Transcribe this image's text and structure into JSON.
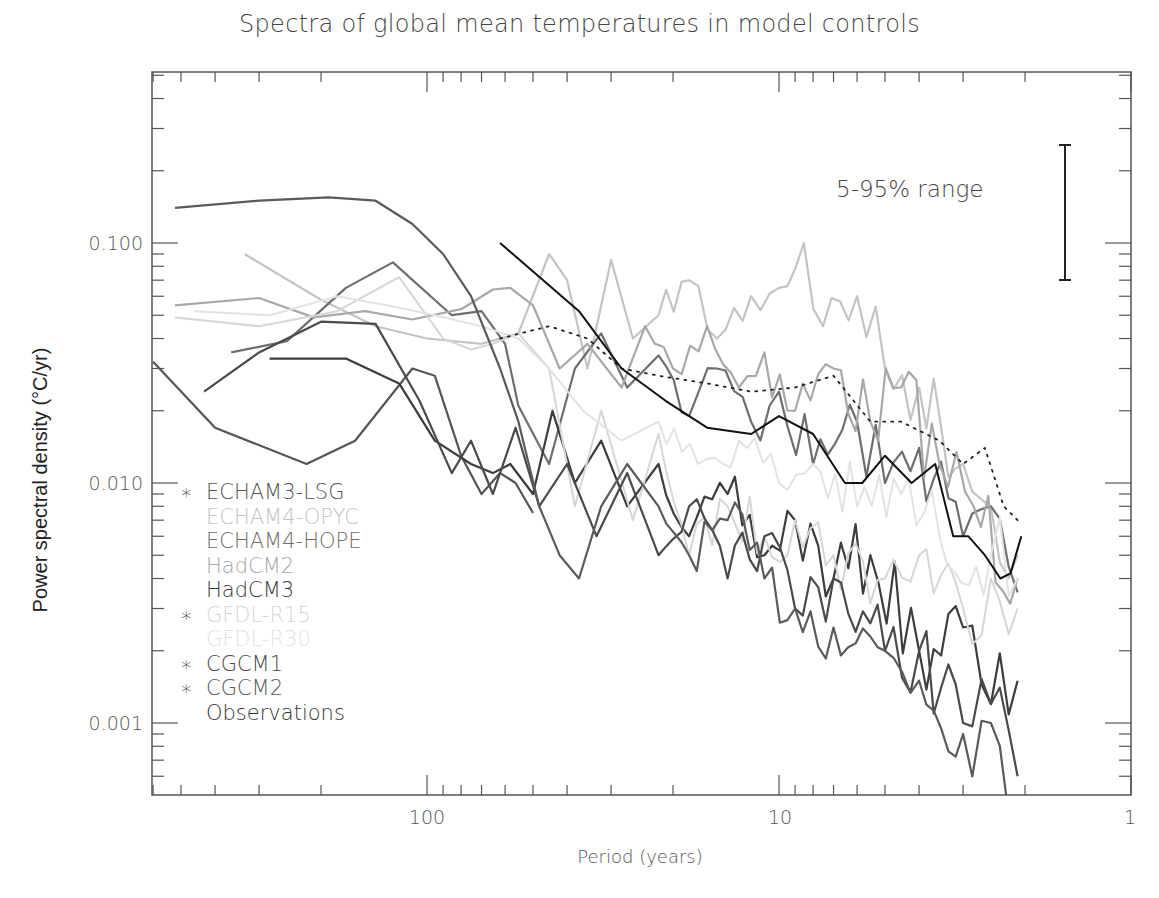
{
  "chart_data": {
    "type": "line",
    "title": "Spectra of global mean temperatures in model controls",
    "xlabel": "Period (years)",
    "ylabel": "Power spectral density (°C/yr)",
    "x_scale": "log",
    "y_scale": "log",
    "x_reversed": true,
    "xlim": [
      600,
      1
    ],
    "ylim": [
      0.0005,
      0.5
    ],
    "x_ticks": [
      {
        "value": 100,
        "label": "100"
      },
      {
        "value": 10,
        "label": "10"
      },
      {
        "value": 1,
        "label": "1"
      }
    ],
    "y_ticks": [
      {
        "value": 0.1,
        "label": "0.100"
      },
      {
        "value": 0.01,
        "label": "0.010"
      },
      {
        "value": 0.001,
        "label": "0.001"
      }
    ],
    "annotation": {
      "label": "5-95% range",
      "x_period": 1.6,
      "y_low": 0.07,
      "y_high": 0.25
    },
    "legend_position": "lower-left inside",
    "series": [
      {
        "name": "ECHAM3-LSG",
        "marker": "*",
        "color": "#555555",
        "width": 2.2,
        "points": [
          [
            600,
            0.032
          ],
          [
            400,
            0.017
          ],
          [
            220,
            0.012
          ],
          [
            160,
            0.015
          ],
          [
            110,
            0.03
          ],
          [
            95,
            0.028
          ],
          [
            80,
            0.013
          ],
          [
            70,
            0.009
          ],
          [
            62,
            0.011
          ],
          [
            56,
            0.01
          ],
          [
            50,
            0.0075
          ]
        ]
      },
      {
        "name": "ECHAM4-OPYC",
        "marker": "",
        "color": "#c4c4c4",
        "width": 2.2,
        "points": [
          [
            330,
            0.09
          ],
          [
            200,
            0.058
          ],
          [
            140,
            0.045
          ],
          [
            100,
            0.04
          ],
          [
            70,
            0.038
          ],
          [
            55,
            0.042
          ],
          [
            45,
            0.09
          ],
          [
            40,
            0.07
          ],
          [
            35,
            0.03
          ],
          [
            30,
            0.085
          ],
          [
            26,
            0.04
          ],
          [
            22,
            0.05
          ],
          [
            18,
            0.07
          ],
          [
            15,
            0.04
          ],
          [
            12,
            0.06
          ],
          [
            10,
            0.065
          ],
          [
            8.5,
            0.1
          ],
          [
            7.5,
            0.045
          ],
          [
            6,
            0.06
          ],
          [
            5,
            0.03
          ],
          [
            4,
            0.025
          ],
          [
            3,
            0.012
          ],
          [
            2.5,
            0.008
          ],
          [
            2.1,
            0.005
          ]
        ]
      },
      {
        "name": "ECHAM4-HOPE",
        "marker": "",
        "color": "#6e6e6e",
        "width": 2.2,
        "points": [
          [
            360,
            0.035
          ],
          [
            250,
            0.039
          ],
          [
            170,
            0.065
          ],
          [
            125,
            0.083
          ],
          [
            85,
            0.05
          ],
          [
            70,
            0.052
          ],
          [
            60,
            0.038
          ],
          [
            55,
            0.021
          ],
          [
            45,
            0.012
          ],
          [
            38,
            0.03
          ],
          [
            32,
            0.042
          ],
          [
            27,
            0.025
          ],
          [
            22,
            0.034
          ],
          [
            18,
            0.019
          ],
          [
            15,
            0.03
          ],
          [
            12,
            0.018
          ],
          [
            10,
            0.024
          ],
          [
            8,
            0.012
          ],
          [
            6,
            0.018
          ],
          [
            5,
            0.01
          ],
          [
            4,
            0.014
          ],
          [
            3,
            0.006
          ],
          [
            2.5,
            0.008
          ],
          [
            2.1,
            0.0035
          ]
        ]
      },
      {
        "name": "HadCM2",
        "marker": "",
        "color": "#a8a8a8",
        "width": 2.2,
        "points": [
          [
            520,
            0.055
          ],
          [
            300,
            0.059
          ],
          [
            210,
            0.049
          ],
          [
            150,
            0.052
          ],
          [
            110,
            0.048
          ],
          [
            80,
            0.053
          ],
          [
            65,
            0.064
          ],
          [
            58,
            0.065
          ],
          [
            50,
            0.055
          ],
          [
            42,
            0.03
          ],
          [
            35,
            0.038
          ],
          [
            28,
            0.025
          ],
          [
            24,
            0.045
          ],
          [
            20,
            0.03
          ],
          [
            16,
            0.045
          ],
          [
            13,
            0.025
          ],
          [
            11,
            0.035
          ],
          [
            9,
            0.02
          ],
          [
            7,
            0.03
          ],
          [
            5.5,
            0.018
          ],
          [
            4.5,
            0.025
          ],
          [
            3.5,
            0.012
          ],
          [
            2.8,
            0.008
          ],
          [
            2.1,
            0.004
          ]
        ]
      },
      {
        "name": "HadCM3",
        "marker": "",
        "color": "#3c3c3c",
        "width": 2.2,
        "points": [
          [
            280,
            0.033
          ],
          [
            170,
            0.033
          ],
          [
            120,
            0.026
          ],
          [
            95,
            0.015
          ],
          [
            75,
            0.012
          ],
          [
            65,
            0.011
          ],
          [
            58,
            0.012
          ],
          [
            50,
            0.009
          ],
          [
            44,
            0.02
          ],
          [
            38,
            0.01
          ],
          [
            32,
            0.015
          ],
          [
            27,
            0.008
          ],
          [
            22,
            0.012
          ],
          [
            18,
            0.006
          ],
          [
            14,
            0.009
          ],
          [
            11,
            0.005
          ],
          [
            9,
            0.007
          ],
          [
            7,
            0.004
          ],
          [
            5.5,
            0.005
          ],
          [
            4,
            0.002
          ],
          [
            3,
            0.0025
          ],
          [
            2.5,
            0.0012
          ],
          [
            2.1,
            0.0015
          ]
        ]
      },
      {
        "name": "GFDL-R15",
        "marker": "*",
        "color": "#d6d6d6",
        "width": 2.0,
        "points": [
          [
            520,
            0.049
          ],
          [
            300,
            0.045
          ],
          [
            180,
            0.052
          ],
          [
            120,
            0.072
          ],
          [
            90,
            0.04
          ],
          [
            75,
            0.036
          ],
          [
            65,
            0.038
          ],
          [
            55,
            0.042
          ],
          [
            45,
            0.03
          ],
          [
            38,
            0.008
          ],
          [
            32,
            0.02
          ],
          [
            26,
            0.007
          ],
          [
            22,
            0.016
          ],
          [
            18,
            0.005
          ],
          [
            14,
            0.008
          ],
          [
            11,
            0.006
          ],
          [
            9,
            0.007
          ],
          [
            7,
            0.005
          ],
          [
            5,
            0.004
          ],
          [
            4,
            0.005
          ],
          [
            3,
            0.003
          ],
          [
            2.5,
            0.004
          ],
          [
            2.1,
            0.003
          ]
        ]
      },
      {
        "name": "GFDL-R30",
        "marker": "",
        "color": "#e3e3e3",
        "width": 2.0,
        "points": [
          [
            460,
            0.052
          ],
          [
            280,
            0.05
          ],
          [
            180,
            0.06
          ],
          [
            130,
            0.055
          ],
          [
            95,
            0.05
          ],
          [
            70,
            0.045
          ],
          [
            55,
            0.04
          ],
          [
            45,
            0.03
          ],
          [
            36,
            0.02
          ],
          [
            28,
            0.015
          ],
          [
            22,
            0.018
          ],
          [
            17,
            0.012
          ],
          [
            13,
            0.015
          ],
          [
            10,
            0.01
          ],
          [
            8,
            0.012
          ],
          [
            6,
            0.008
          ],
          [
            4.5,
            0.009
          ],
          [
            3.5,
            0.006
          ],
          [
            2.5,
            0.005
          ],
          [
            2.1,
            0.004
          ]
        ]
      },
      {
        "name": "CGCM1",
        "marker": "*",
        "color": "#4a4a4a",
        "width": 2.2,
        "points": [
          [
            430,
            0.024
          ],
          [
            300,
            0.035
          ],
          [
            200,
            0.047
          ],
          [
            140,
            0.046
          ],
          [
            105,
            0.022
          ],
          [
            85,
            0.011
          ],
          [
            75,
            0.015
          ],
          [
            65,
            0.009
          ],
          [
            56,
            0.017
          ],
          [
            48,
            0.008
          ],
          [
            40,
            0.012
          ],
          [
            33,
            0.006
          ],
          [
            27,
            0.011
          ],
          [
            22,
            0.005
          ],
          [
            18,
            0.008
          ],
          [
            14,
            0.004
          ],
          [
            11,
            0.006
          ],
          [
            9,
            0.003
          ],
          [
            7,
            0.004
          ],
          [
            5,
            0.002
          ],
          [
            4,
            0.002
          ],
          [
            3,
            0.001
          ],
          [
            2.5,
            0.0012
          ],
          [
            2.1,
            0.0006
          ]
        ]
      },
      {
        "name": "CGCM2",
        "marker": "*",
        "color": "#5a5a5a",
        "width": 2.2,
        "points": [
          [
            520,
            0.14
          ],
          [
            300,
            0.15
          ],
          [
            190,
            0.155
          ],
          [
            140,
            0.15
          ],
          [
            110,
            0.12
          ],
          [
            90,
            0.09
          ],
          [
            75,
            0.06
          ],
          [
            62,
            0.03
          ],
          [
            55,
            0.018
          ],
          [
            48,
            0.008
          ],
          [
            42,
            0.005
          ],
          [
            37,
            0.004
          ],
          [
            32,
            0.008
          ],
          [
            27,
            0.012
          ],
          [
            22,
            0.008
          ],
          [
            18,
            0.005
          ],
          [
            14,
            0.007
          ],
          [
            11,
            0.004
          ],
          [
            9,
            0.003
          ],
          [
            7,
            0.0025
          ],
          [
            5,
            0.002
          ],
          [
            4,
            0.0015
          ],
          [
            3,
            0.0009
          ],
          [
            2.5,
            0.001
          ],
          [
            2.1,
            0.0005
          ]
        ]
      },
      {
        "name": "Observations",
        "marker": "",
        "color": "#222222",
        "width": 1.8,
        "dash": "2,6",
        "points": [
          [
            62,
            0.04
          ],
          [
            45,
            0.045
          ],
          [
            35,
            0.04
          ],
          [
            28,
            0.03
          ],
          [
            22,
            0.028
          ],
          [
            16,
            0.026
          ],
          [
            12,
            0.024
          ],
          [
            9,
            0.025
          ],
          [
            7,
            0.028
          ],
          [
            5.5,
            0.018
          ],
          [
            4.5,
            0.018
          ],
          [
            3.5,
            0.015
          ],
          [
            3,
            0.012
          ],
          [
            2.6,
            0.014
          ],
          [
            2.3,
            0.008
          ],
          [
            2.1,
            0.007
          ]
        ]
      },
      {
        "name": "HadCM3 (bold trend)",
        "legend": false,
        "color": "#111111",
        "width": 2.0,
        "points": [
          [
            62,
            0.1
          ],
          [
            37,
            0.052
          ],
          [
            28,
            0.03
          ],
          [
            21,
            0.022
          ],
          [
            16,
            0.017
          ],
          [
            12,
            0.016
          ],
          [
            10,
            0.019
          ],
          [
            8,
            0.016
          ],
          [
            6.5,
            0.01
          ],
          [
            5.8,
            0.01
          ],
          [
            5,
            0.013
          ],
          [
            4.2,
            0.01
          ],
          [
            3.6,
            0.012
          ],
          [
            3.2,
            0.006
          ],
          [
            2.9,
            0.006
          ],
          [
            2.6,
            0.005
          ],
          [
            2.35,
            0.004
          ],
          [
            2.2,
            0.0042
          ],
          [
            2.05,
            0.006
          ]
        ]
      }
    ],
    "noise_overlay": {
      "description": "dense high-frequency wiggle bands between periods 20 and 2 years",
      "seed": 7
    }
  },
  "legend": {
    "items": [
      {
        "label": "ECHAM3-LSG",
        "star": true,
        "color": "#555555"
      },
      {
        "label": "ECHAM4-OPYC",
        "star": false,
        "color": "#c4c4c4"
      },
      {
        "label": "ECHAM4-HOPE",
        "star": false,
        "color": "#6e6e6e"
      },
      {
        "label": "HadCM2",
        "star": false,
        "color": "#a8a8a8"
      },
      {
        "label": "HadCM3",
        "star": false,
        "color": "#3c3c3c"
      },
      {
        "label": "GFDL-R15",
        "star": true,
        "color": "#d6d6d6"
      },
      {
        "label": "GFDL-R30",
        "star": false,
        "color": "#e3e3e3"
      },
      {
        "label": "CGCM1",
        "star": true,
        "color": "#4a4a4a"
      },
      {
        "label": "CGCM2",
        "star": true,
        "color": "#5a5a5a"
      },
      {
        "label": "Observations",
        "star": false,
        "color": "#333333"
      }
    ],
    "star_glyph": "∗"
  }
}
